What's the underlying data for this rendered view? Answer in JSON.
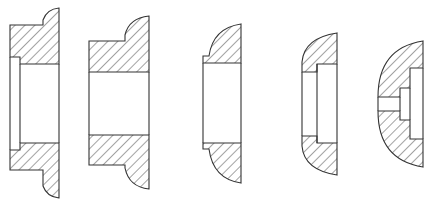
{
  "diagram": {
    "type": "cross-section drawings",
    "colors": {
      "line": "#333333",
      "hatch": "#333333",
      "background": "#ffffff"
    },
    "hatch": {
      "angle_deg": 45,
      "spacing_px": 7
    },
    "figures": [
      {
        "id": "fig-1",
        "shape": "stepped flanged bushing with rounded lip and counterbore"
      },
      {
        "id": "fig-2",
        "shape": "flanged bushing with rounded lip, straight bore"
      },
      {
        "id": "fig-3",
        "shape": "domed bushing with small shoulder, straight bore"
      },
      {
        "id": "fig-4",
        "shape": "domed bushing with counterbore"
      },
      {
        "id": "fig-5",
        "shape": "domed cap with stepped blind bore"
      }
    ]
  }
}
